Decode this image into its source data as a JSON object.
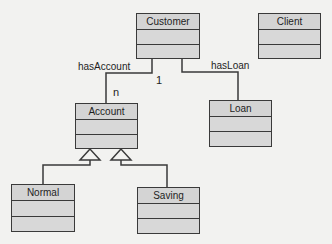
{
  "diagram": {
    "type": "uml-class-diagram",
    "classes": [
      {
        "id": "customer",
        "name": "Customer"
      },
      {
        "id": "client",
        "name": "Client"
      },
      {
        "id": "account",
        "name": "Account"
      },
      {
        "id": "loan",
        "name": "Loan"
      },
      {
        "id": "normal",
        "name": "Normal"
      },
      {
        "id": "saving",
        "name": "Saving"
      }
    ],
    "associations": [
      {
        "from": "Customer",
        "to": "Account",
        "label": "hasAccount",
        "source_multiplicity": "1",
        "target_multiplicity": "n"
      },
      {
        "from": "Customer",
        "to": "Loan",
        "label": "hasLoan"
      }
    ],
    "generalizations": [
      {
        "child": "Normal",
        "parent": "Account"
      },
      {
        "child": "Saving",
        "parent": "Account"
      }
    ]
  },
  "labels": {
    "has_account": "hasAccount",
    "has_loan": "hasLoan",
    "mult_one": "1",
    "mult_n": "n"
  },
  "colors": {
    "background": "#f2f2f0",
    "box_fill": "#d4d4d4",
    "line": "#3a3a3a"
  }
}
